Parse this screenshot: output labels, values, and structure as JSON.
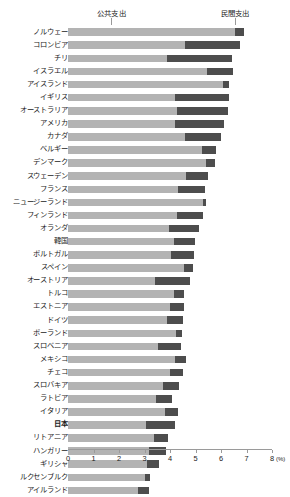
{
  "legend": {
    "public_label": "公共支出",
    "private_label": "民間支出"
  },
  "axis": {
    "unit": "(%)",
    "ticks": [
      0,
      1,
      2,
      3,
      4,
      5,
      6,
      7,
      8
    ],
    "tick_labels": [
      "0",
      "1",
      "2",
      "3",
      "4",
      "5",
      "6",
      "7",
      "8"
    ],
    "min": 0,
    "max": 8
  },
  "chart_data": {
    "type": "bar",
    "orientation": "horizontal",
    "stacked": true,
    "title": "",
    "xlabel": "(%)",
    "ylabel": "",
    "xlim": [
      0,
      8
    ],
    "grid": false,
    "legend_position": "top",
    "colors": {
      "public": "#b3b3b3",
      "private": "#4d4d4d"
    },
    "series": [
      {
        "name": "公共支出",
        "values": [
          6.55,
          4.59,
          3.88,
          5.45,
          6.08,
          4.2,
          4.27,
          4.2,
          4.59,
          5.25,
          5.41,
          4.63,
          4.31,
          5.29,
          4.27,
          3.96,
          4.16,
          4.04,
          4.55,
          3.41,
          4.16,
          4.0,
          3.88,
          4.24,
          3.53,
          4.2,
          4.0,
          3.73,
          3.45,
          3.8,
          3.06,
          3.39,
          3.18,
          3.1,
          3.02,
          2.75
        ]
      },
      {
        "name": "民間支出",
        "values": [
          0.35,
          2.16,
          2.55,
          1.02,
          0.24,
          2.12,
          2.0,
          1.92,
          1.41,
          0.55,
          0.35,
          0.86,
          1.06,
          0.12,
          1.02,
          1.18,
          0.82,
          0.9,
          0.35,
          1.37,
          0.39,
          0.55,
          0.63,
          0.24,
          0.9,
          0.43,
          0.51,
          0.63,
          0.63,
          0.51,
          1.14,
          0.55,
          0.67,
          0.47,
          0.2,
          0.43
        ]
      }
    ],
    "categories": [
      "ノルウェー",
      "コロンビア",
      "チリ",
      "イスラエル",
      "アイスランド",
      "イギリス",
      "オーストラリア",
      "アメリカ",
      "カナダ",
      "ベルギー",
      "デンマーク",
      "スウェーデン",
      "フランス",
      "ニュージーランド",
      "フィンランド",
      "オランダ",
      "韓国",
      "ポルトガル",
      "スペイン",
      "オーストリア",
      "トルコ",
      "エストニア",
      "ドイツ",
      "ポーランド",
      "スロベニア",
      "メキシコ",
      "チェコ",
      "スロバキア",
      "ラトビア",
      "イタリア",
      "日本",
      "リトアニア",
      "ハンガリー",
      "ギリシャ",
      "ルクセンブルク",
      "アイルランド"
    ],
    "highlight": "日本"
  }
}
